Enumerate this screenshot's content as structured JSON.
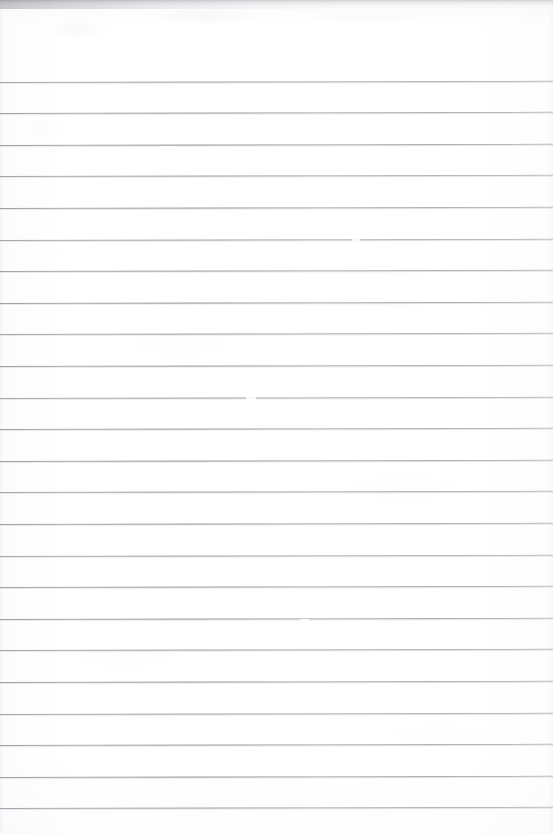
{
  "document": {
    "kind": "scanned-lined-paper",
    "title": "Blank ruled notebook page (scan)",
    "page_width_px": 553,
    "page_height_px": 834,
    "paper_color": "#ffffff",
    "paper_tint": "#fdfdfe",
    "content_text": "",
    "handwriting_present": "no",
    "printed_text_present": "no"
  },
  "ruling": {
    "line_color": "#bfc3c7",
    "line_color_soft": "#cdd0d4",
    "line_thickness_px": 1,
    "line_spacing_px": 31.6,
    "first_line_y_px": 81.5,
    "line_count": 24,
    "left_margin_x_px": 0,
    "right_end_x_px": 553,
    "tilt_deg": -0.12,
    "margin_rule_present": "no",
    "line_y_positions": [
      81.5,
      113.1,
      144.7,
      176.3,
      207.9,
      239.5,
      271.1,
      302.7,
      334.3,
      365.9,
      397.5,
      429.1,
      460.7,
      492.3,
      523.9,
      555.5,
      587.1,
      618.7,
      650.3,
      681.9,
      713.5,
      745.1,
      776.7,
      808.3
    ],
    "line_left_inset_px": [
      0,
      0,
      0,
      0,
      0,
      0,
      0,
      0,
      0,
      0,
      0,
      0,
      0,
      0,
      0,
      0,
      0,
      0,
      0,
      0,
      0,
      0,
      0,
      0
    ]
  },
  "scan_artifacts": {
    "top_edge_shadow": {
      "color": "#aaacb0",
      "height_px": 9,
      "strongest_side": "left"
    },
    "edge_vignette_color": "#e9eaec",
    "blotches": [
      {
        "x": 42,
        "y": 18,
        "w": 70,
        "h": 22,
        "color": "#f5f5f7",
        "opacity": 0.62
      },
      {
        "x": 150,
        "y": 8,
        "w": 110,
        "h": 16,
        "color": "#f2f2f4",
        "opacity": 0.55
      },
      {
        "x": 300,
        "y": 10,
        "w": 130,
        "h": 14,
        "color": "#f6f6f8",
        "opacity": 0.45
      },
      {
        "x": 20,
        "y": 118,
        "w": 46,
        "h": 20,
        "color": "#fafafb",
        "opacity": 0.6
      },
      {
        "x": 120,
        "y": 330,
        "w": 120,
        "h": 30,
        "color": "#fbfbfc",
        "opacity": 0.5
      },
      {
        "x": 330,
        "y": 470,
        "w": 150,
        "h": 36,
        "color": "#fbfbfc",
        "opacity": 0.45
      },
      {
        "x": 60,
        "y": 640,
        "w": 130,
        "h": 34,
        "color": "#fcfcfd",
        "opacity": 0.5
      },
      {
        "x": 380,
        "y": 720,
        "w": 120,
        "h": 28,
        "color": "#fbfbfc",
        "opacity": 0.45
      },
      {
        "x": 210,
        "y": 790,
        "w": 160,
        "h": 30,
        "color": "#fcfcfd",
        "opacity": 0.4
      }
    ],
    "rule_gaps": [
      {
        "x": 160,
        "y": 147,
        "w": 14
      },
      {
        "x": 158,
        "y": 179,
        "w": 10
      },
      {
        "x": 466,
        "y": 116,
        "w": 9
      },
      {
        "x": 352,
        "y": 240,
        "w": 8
      },
      {
        "x": 246,
        "y": 398,
        "w": 10
      },
      {
        "x": 300,
        "y": 620,
        "w": 9
      }
    ]
  }
}
